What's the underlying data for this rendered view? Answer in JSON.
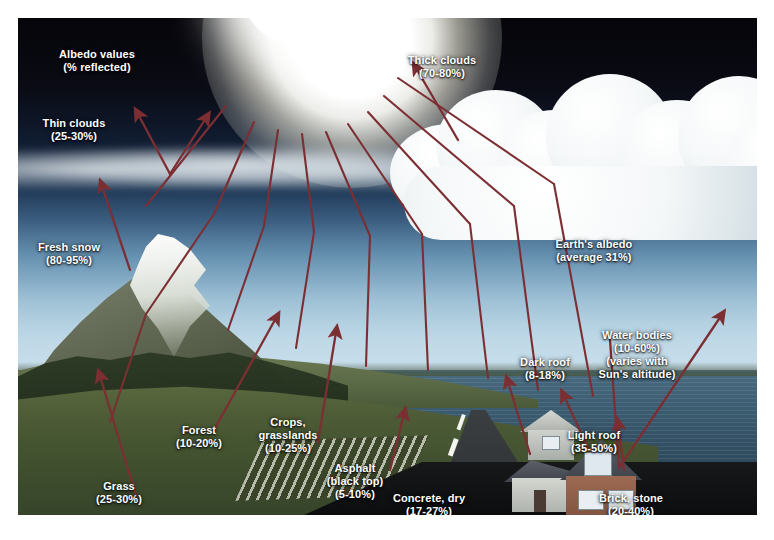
{
  "diagram": {
    "title": "Albedo values (% reflected)",
    "colors": {
      "arrow": "#7c2f33",
      "label_text": "#ffffff",
      "sky_top": "#05050a",
      "sky_bottom": "#c9dfec",
      "sea": "#3d5e73",
      "sun": "#ffffff",
      "frame": "#ffffff"
    }
  },
  "labels": [
    {
      "id": "albedo-values",
      "name": "Albedo values",
      "value": "(% reflected)",
      "text": "Albedo values\n(% reflected)",
      "x": 79,
      "y": 30,
      "align": "center"
    },
    {
      "id": "thin-clouds",
      "name": "Thin clouds",
      "value": "(25-30%)",
      "text": "Thin clouds\n(25-30%)",
      "x": 47,
      "y": 99,
      "align": "center"
    },
    {
      "id": "thick-clouds",
      "name": "Thick clouds",
      "value": "(70-80%)",
      "text": "Thick clouds\n(70-80%)",
      "x": 424,
      "y": 36,
      "align": "center"
    },
    {
      "id": "fresh-snow",
      "name": "Fresh snow",
      "value": "(80-95%)",
      "text": "Fresh snow\n(80-95%)",
      "x": 45,
      "y": 223,
      "align": "center"
    },
    {
      "id": "earths-albedo",
      "name": "Earth's albedo",
      "value": "(average 31%)",
      "text": "Earth's albedo\n(average 31%)",
      "x": 575,
      "y": 220,
      "align": "center"
    },
    {
      "id": "water-bodies",
      "name": "Water bodies",
      "value": "(10-60%)",
      "text": "Water bodies\n(10-60%)\n(varies with\nSun's altitude)",
      "x": 618,
      "y": 311,
      "align": "center"
    },
    {
      "id": "dark-roof",
      "name": "Dark roof",
      "value": "(8-18%)",
      "text": "Dark roof\n(8-18%)",
      "x": 527,
      "y": 338,
      "align": "center"
    },
    {
      "id": "forest",
      "name": "Forest",
      "value": "(10-20%)",
      "text": "Forest\n(10-20%)",
      "x": 180,
      "y": 406,
      "align": "center"
    },
    {
      "id": "crops",
      "name": "Crops, grasslands",
      "value": "(10-25%)",
      "text": "Crops,\ngrasslands\n(10-25%)",
      "x": 269,
      "y": 398,
      "align": "center"
    },
    {
      "id": "light-roof",
      "name": "Light roof",
      "value": "(35-50%)",
      "text": "Light roof\n(35-50%)",
      "x": 575,
      "y": 411,
      "align": "center"
    },
    {
      "id": "asphalt",
      "name": "Asphalt (black top)",
      "value": "(5-10%)",
      "text": "Asphalt\n(black top)\n(5-10%)",
      "x": 337,
      "y": 444,
      "align": "center"
    },
    {
      "id": "grass",
      "name": "Grass",
      "value": "(25-30%)",
      "text": "Grass\n(25-30%)",
      "x": 100,
      "y": 462,
      "align": "center"
    },
    {
      "id": "concrete",
      "name": "Concrete, dry",
      "value": "(17-27%)",
      "text": "Concrete, dry\n(17-27%)",
      "x": 410,
      "y": 474,
      "align": "center"
    },
    {
      "id": "brick-stone",
      "name": "Brick, stone",
      "value": "(20-40%)",
      "text": "Brick, stone\n(20-40%)",
      "x": 612,
      "y": 474,
      "align": "center"
    }
  ],
  "albedo_data": {
    "type": "table",
    "title": "Albedo values (% reflected)",
    "columns": [
      "Surface",
      "Albedo (%)"
    ],
    "rows": [
      [
        "Thin clouds",
        "25-30%"
      ],
      [
        "Thick clouds",
        "70-80%"
      ],
      [
        "Fresh snow",
        "80-95%"
      ],
      [
        "Earth's albedo (average)",
        "31%"
      ],
      [
        "Water bodies (varies with Sun's altitude)",
        "10-60%"
      ],
      [
        "Dark roof",
        "8-18%"
      ],
      [
        "Light roof",
        "35-50%"
      ],
      [
        "Forest",
        "10-20%"
      ],
      [
        "Crops, grasslands",
        "10-25%"
      ],
      [
        "Asphalt (black top)",
        "5-10%"
      ],
      [
        "Grass",
        "25-30%"
      ],
      [
        "Concrete, dry",
        "17-27%"
      ],
      [
        "Brick, stone",
        "20-40%"
      ]
    ]
  }
}
